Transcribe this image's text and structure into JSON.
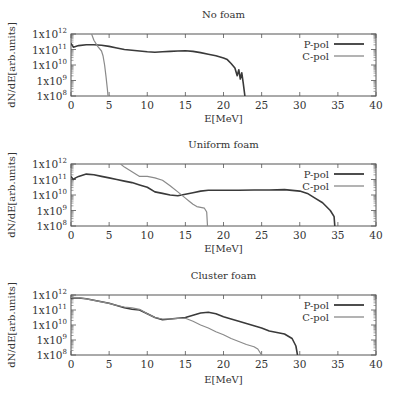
{
  "chart_data": [
    {
      "type": "line",
      "title": "No foam",
      "xlabel": "E[MeV]",
      "ylabel": "dN/dE[arb.units]",
      "xlim": [
        0,
        40
      ],
      "ylim": [
        100000000.0,
        1000000000000.0
      ],
      "yscale": "log",
      "xticks": [
        "0",
        "5",
        "10",
        "15",
        "20",
        "25",
        "30",
        "35",
        "40"
      ],
      "yticks": [
        {
          "base": "1x10",
          "exp": "12"
        },
        {
          "base": "1x10",
          "exp": "11"
        },
        {
          "base": "1x10",
          "exp": "10"
        },
        {
          "base": "1x10",
          "exp": "9"
        },
        {
          "base": "1x10",
          "exp": "8"
        }
      ],
      "legend_position": "top-right",
      "series": [
        {
          "name": "P-pol",
          "color": "#3a3a3a",
          "x": [
            0,
            0.3,
            0.6,
            1,
            2,
            3,
            4,
            5,
            6,
            7,
            8,
            9,
            10,
            11,
            12,
            13,
            14,
            15,
            16,
            17,
            18,
            19,
            20,
            20.5,
            21,
            21.5,
            21.8,
            22,
            22.2,
            22.4,
            22.6,
            22.8
          ],
          "y_log10": [
            11.4,
            11.15,
            11.2,
            11.25,
            11.3,
            11.3,
            11.28,
            11.2,
            11.1,
            11.0,
            10.95,
            10.9,
            10.85,
            10.82,
            10.85,
            10.88,
            10.9,
            10.92,
            10.88,
            10.8,
            10.7,
            10.6,
            10.45,
            10.35,
            10.1,
            9.8,
            9.3,
            9.7,
            9.1,
            9.5,
            8.8,
            8.0
          ]
        },
        {
          "name": "C-pol",
          "color": "#8a8a8a",
          "x": [
            2.7,
            3.0,
            3.5,
            4.0,
            4.2,
            4.4,
            4.6,
            4.8,
            4.85
          ],
          "y_log10": [
            12.0,
            11.6,
            11.2,
            10.9,
            10.6,
            10.0,
            9.2,
            8.3,
            8.0
          ]
        }
      ]
    },
    {
      "type": "line",
      "title": "Uniform foam",
      "xlabel": "E[MeV]",
      "ylabel": "dN/dE[arb.units]",
      "xlim": [
        0,
        40
      ],
      "ylim": [
        100000000.0,
        1000000000000.0
      ],
      "yscale": "log",
      "xticks": [
        "0",
        "5",
        "10",
        "15",
        "20",
        "25",
        "30",
        "35",
        "40"
      ],
      "yticks": [
        {
          "base": "1x10",
          "exp": "12"
        },
        {
          "base": "1x10",
          "exp": "11"
        },
        {
          "base": "1x10",
          "exp": "10"
        },
        {
          "base": "1x10",
          "exp": "9"
        },
        {
          "base": "1x10",
          "exp": "8"
        }
      ],
      "legend_position": "top-right",
      "series": [
        {
          "name": "P-pol",
          "color": "#3a3a3a",
          "x": [
            0,
            0.3,
            0.6,
            1,
            2,
            3,
            4,
            5,
            6,
            7,
            8,
            9,
            10,
            11,
            12,
            13,
            14,
            15,
            16,
            17,
            18,
            20,
            22,
            24,
            26,
            28,
            30,
            31,
            32,
            33,
            34,
            34.5,
            34.6
          ],
          "y_log10": [
            11.2,
            11.0,
            11.1,
            11.2,
            11.35,
            11.3,
            11.2,
            11.1,
            11.0,
            10.9,
            10.8,
            10.65,
            10.5,
            10.2,
            10.1,
            10.0,
            9.95,
            10.05,
            10.15,
            10.25,
            10.3,
            10.3,
            10.3,
            10.32,
            10.32,
            10.35,
            10.25,
            10.1,
            9.8,
            9.5,
            9.0,
            8.6,
            8.0
          ]
        },
        {
          "name": "C-pol",
          "color": "#8a8a8a",
          "x": [
            6.5,
            7,
            8,
            9,
            10,
            11,
            12,
            13,
            14,
            15,
            15.5,
            16,
            16.5,
            17,
            17.5,
            17.8,
            17.9
          ],
          "y_log10": [
            12.0,
            11.8,
            11.5,
            11.2,
            11.2,
            11.1,
            10.95,
            10.6,
            10.2,
            9.8,
            9.6,
            9.4,
            9.25,
            9.2,
            9.15,
            8.9,
            8.0
          ]
        }
      ]
    },
    {
      "type": "line",
      "title": "Cluster foam",
      "xlabel": "E[MeV]",
      "ylabel": "dN/dE[arb.units]",
      "xlim": [
        0,
        40
      ],
      "ylim": [
        100000000.0,
        1000000000000.0
      ],
      "yscale": "log",
      "xticks": [
        "0",
        "5",
        "10",
        "15",
        "20",
        "25",
        "30",
        "35",
        "40"
      ],
      "yticks": [
        {
          "base": "1x10",
          "exp": "12"
        },
        {
          "base": "1x10",
          "exp": "11"
        },
        {
          "base": "1x10",
          "exp": "10"
        },
        {
          "base": "1x10",
          "exp": "9"
        },
        {
          "base": "1x10",
          "exp": "8"
        }
      ],
      "legend_position": "top-right",
      "series": [
        {
          "name": "P-pol",
          "color": "#3a3a3a",
          "x": [
            0,
            1,
            2,
            3,
            4,
            5,
            6,
            7,
            8,
            9,
            10,
            11,
            12,
            13,
            14,
            15,
            16,
            17,
            18,
            19,
            20,
            21,
            22,
            23,
            24,
            25,
            26,
            27,
            28,
            29,
            29.5,
            29.7
          ],
          "y_log10": [
            11.8,
            11.8,
            11.75,
            11.65,
            11.55,
            11.45,
            11.3,
            11.15,
            11.05,
            11.0,
            10.75,
            10.5,
            10.35,
            10.4,
            10.45,
            10.5,
            10.65,
            10.8,
            10.85,
            10.75,
            10.55,
            10.4,
            10.25,
            10.1,
            9.95,
            9.8,
            9.6,
            9.5,
            9.4,
            9.1,
            8.6,
            8.0
          ]
        },
        {
          "name": "C-pol",
          "color": "#8a8a8a",
          "x": [
            0,
            1,
            2,
            3,
            4,
            5,
            6,
            7,
            8,
            9,
            10,
            11,
            12,
            13,
            14,
            15,
            16,
            17,
            18,
            19,
            20,
            21,
            22,
            23,
            24,
            24.5,
            25
          ],
          "y_log10": [
            11.85,
            11.82,
            11.75,
            11.65,
            11.55,
            11.45,
            11.3,
            11.2,
            11.15,
            11.05,
            10.75,
            10.5,
            10.4,
            10.4,
            10.45,
            10.45,
            10.25,
            10.0,
            9.8,
            9.55,
            9.35,
            9.1,
            8.9,
            8.7,
            8.55,
            8.4,
            8.0
          ]
        }
      ]
    }
  ]
}
